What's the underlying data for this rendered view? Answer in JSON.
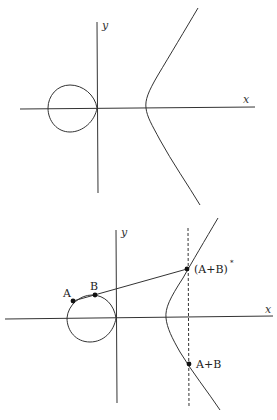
{
  "figures": [
    {
      "id": "curve-only",
      "axes": {
        "x_label": "x",
        "y_label": "y"
      }
    },
    {
      "id": "point-addition",
      "axes": {
        "x_label": "x",
        "y_label": "y"
      },
      "points": [
        {
          "label": "A"
        },
        {
          "label": "B"
        },
        {
          "label": "(A+B)",
          "superscript": "*"
        },
        {
          "label": "A+B"
        }
      ]
    }
  ],
  "colors": {
    "stroke": "#333333",
    "point": "#111111",
    "background": "#ffffff"
  }
}
